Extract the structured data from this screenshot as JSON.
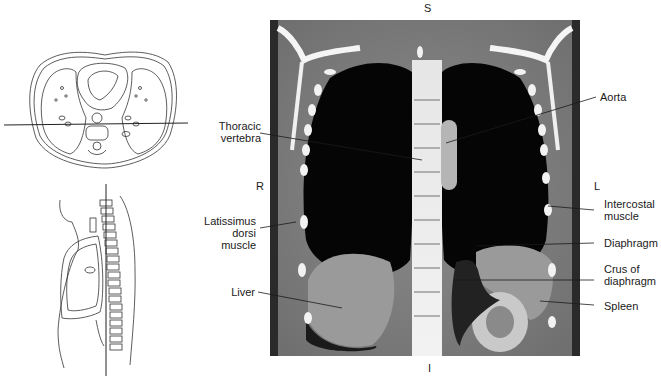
{
  "figure": {
    "orientation": {
      "superior": "S",
      "inferior": "I",
      "right": "R",
      "left": "L"
    },
    "left_labels": [
      {
        "id": "thoracic-vertebra",
        "lines": [
          "Thoracic",
          "vertebra"
        ]
      },
      {
        "id": "latissimus-dorsi-muscle",
        "lines": [
          "Latissimus",
          "dorsi",
          "muscle"
        ]
      },
      {
        "id": "liver",
        "lines": [
          "Liver"
        ]
      }
    ],
    "right_labels": [
      {
        "id": "aorta",
        "lines": [
          "Aorta"
        ]
      },
      {
        "id": "intercostal-muscle",
        "lines": [
          "Intercostal",
          "muscle"
        ]
      },
      {
        "id": "diaphragm",
        "lines": [
          "Diaphragm"
        ]
      },
      {
        "id": "crus-of-diaphragm",
        "lines": [
          "Crus of",
          "diaphragm"
        ]
      },
      {
        "id": "spleen",
        "lines": [
          "Spleen"
        ]
      }
    ],
    "reference_diagrams": [
      {
        "id": "axial-reference",
        "description": "axial cross-section with coronal plane line"
      },
      {
        "id": "sagittal-reference",
        "description": "sagittal body outline with coronal plane line"
      }
    ],
    "image": {
      "description": "coronal CT of thorax and upper abdomen"
    }
  }
}
